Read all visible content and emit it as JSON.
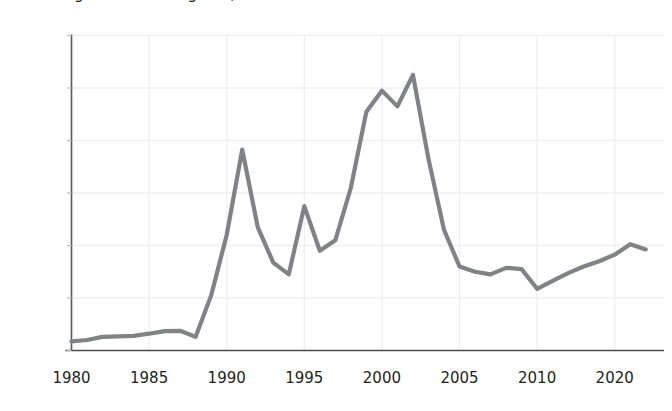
{
  "chart_data": {
    "type": "line",
    "title": "Figure: Annual figures, 1980 to 2021",
    "xlabel": "",
    "ylabel": "",
    "xlim": [
      1980,
      2021
    ],
    "ylim": [
      0,
      120000
    ],
    "grid": true,
    "legend": "none",
    "line_color": "#808285",
    "gridline_color": "#f0f0f1",
    "axis_color": "#58595b",
    "ytick_labels": [
      "120,000",
      "100,000",
      "80,000",
      "60,000",
      "40,000",
      "20,000",
      "0"
    ],
    "ytick_values": [
      120000,
      100000,
      80000,
      60000,
      40000,
      20000,
      0
    ],
    "xtick_labels": [
      "1980",
      "1985",
      "1990",
      "1995",
      "2000",
      "2005",
      "2010",
      "2020"
    ],
    "xtick_values": [
      1980,
      1985,
      1990,
      1995,
      2000,
      2005,
      2010,
      2015
    ],
    "x": [
      1980,
      1981,
      1982,
      1983,
      1984,
      1985,
      1986,
      1987,
      1988,
      1989,
      1990,
      1991,
      1992,
      1993,
      1994,
      1995,
      1996,
      1997,
      1998,
      1999,
      2000,
      2001,
      2002,
      2003,
      2004,
      2005,
      2006,
      2007,
      2008,
      2009,
      2010,
      2011,
      2012,
      2013,
      2014,
      2015,
      2016,
      2017
    ],
    "values": [
      3500,
      4000,
      5200,
      5400,
      5600,
      6400,
      7400,
      7500,
      5200,
      21000,
      44000,
      76500,
      47000,
      33500,
      29000,
      55000,
      38000,
      42000,
      62000,
      91000,
      99000,
      93000,
      105000,
      73000,
      46000,
      32000,
      30000,
      29000,
      31500,
      31000,
      23500,
      26500,
      29500,
      32000,
      34000,
      36500,
      40500,
      38500
    ],
    "series": [
      {
        "name": "series-1",
        "values": [
          3500,
          4000,
          5200,
          5400,
          5600,
          6400,
          7400,
          7500,
          5200,
          21000,
          44000,
          76500,
          47000,
          33500,
          29000,
          55000,
          38000,
          42000,
          62000,
          91000,
          99000,
          93000,
          105000,
          73000,
          46000,
          32000,
          30000,
          29000,
          31500,
          31000,
          23500,
          26500,
          29500,
          32000,
          34000,
          36500,
          40500,
          38500
        ]
      }
    ]
  }
}
